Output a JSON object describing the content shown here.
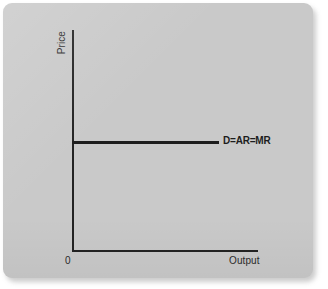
{
  "figure": {
    "background_color": "#c9c9c9",
    "line_color": "#1d1d1d",
    "axis_color": "#232323"
  },
  "chart_data": {
    "type": "line",
    "title": "",
    "subtitle": "",
    "xlabel": "Output",
    "ylabel": "Price",
    "origin_label": "0",
    "grid": false,
    "legend_position": "inline-right",
    "xlim": [
      0,
      100
    ],
    "ylim": [
      0,
      100
    ],
    "xticks": [],
    "yticks": [],
    "series": [
      {
        "name": "D=AR=MR",
        "label": "D=AR=MR",
        "description": "Perfectly elastic (horizontal) demand curve facing a firm in perfect competition",
        "x": [
          0,
          79
        ],
        "values": [
          49,
          49
        ],
        "annotation": "D=AR=MR"
      }
    ],
    "annotations": [
      {
        "text": "D=AR=MR",
        "x": 81,
        "y": 49
      },
      {
        "text": "Price",
        "x": 0,
        "y": 100
      },
      {
        "text": "Output",
        "x": 85,
        "y": 0
      },
      {
        "text": "0",
        "x": 0,
        "y": 0
      }
    ]
  }
}
